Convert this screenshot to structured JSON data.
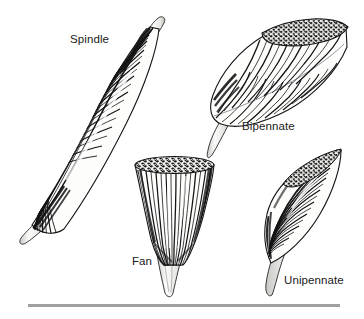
{
  "figure": {
    "background_color": "#ffffff",
    "ink_color": "#121212",
    "tendon_color": "#f2f2f0",
    "rule_color": "#a0a0a0",
    "width": 364,
    "height": 319
  },
  "labels": {
    "spindle": "Spindle",
    "bipennate": "Bipennate",
    "fan": "Fan",
    "unipennate": "Unipennate"
  },
  "specimens": [
    {
      "name": "spindle",
      "label": "Spindle",
      "description": "Fusiform muscle with a long spindle-shaped belly and a tendon at each end, oriented diagonally from upper right to lower left.",
      "tendon_ends": 2,
      "cut_surface": false
    },
    {
      "name": "bipennate",
      "label": "Bipennate",
      "description": "Muscle with fibers inserting obliquely on both sides of a central tendon; the upper right end is shown as a cut, stippled cross-section.",
      "tendon_ends": 1,
      "cut_surface": true
    },
    {
      "name": "fan",
      "label": "Fan",
      "description": "Triangular fan-shaped muscle with a broad stippled cut top and fibers converging onto a single narrow tendon below.",
      "tendon_ends": 1,
      "cut_surface": true
    },
    {
      "name": "unipennate",
      "label": "Unipennate",
      "description": "Muscle with fibers attaching obliquely along one side of a tendon that runs down the lower edge into a long tail.",
      "tendon_ends": 1,
      "cut_surface": true
    }
  ],
  "rule": {
    "name": "bottom-rule",
    "x1": 28,
    "x2": 340,
    "y": 305,
    "thickness": 3
  }
}
